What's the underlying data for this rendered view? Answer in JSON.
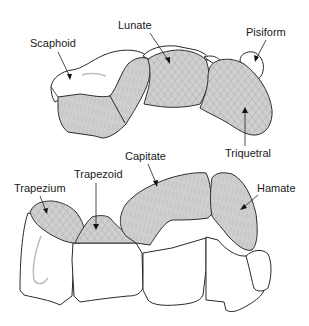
{
  "diagram": {
    "colors": {
      "articular_surface": "#cfcfcf",
      "bone": "#ffffff",
      "outline": "#2a2a2a"
    },
    "proximal_row": {
      "labels": {
        "scaphoid": "Scaphoid",
        "lunate": "Lunate",
        "pisiform": "Pisiform",
        "triquetral": "Triquetral"
      }
    },
    "distal_row": {
      "labels": {
        "trapezium": "Trapezium",
        "trapezoid": "Trapezoid",
        "capitate": "Capitate",
        "hamate": "Hamate"
      }
    }
  }
}
